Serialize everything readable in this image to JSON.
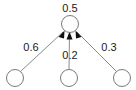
{
  "diagram": {
    "canvas": {
      "width": 136,
      "height": 90,
      "background": "#ffffff"
    },
    "style": {
      "node_stroke": "#7a7a7a",
      "node_fill": "#ffffff",
      "edge_stroke": "#8c8c8c",
      "arrow_fill": "#111111",
      "text_color": "#1a1a1a"
    },
    "output_node": {
      "id": "output",
      "label": "0.5",
      "cx": 70,
      "cy": 24,
      "r": 8.5
    },
    "input_nodes": [
      {
        "id": "input-left",
        "label": "",
        "cx": 15,
        "cy": 78,
        "r": 8.5
      },
      {
        "id": "input-middle",
        "label": "",
        "cx": 69,
        "cy": 78,
        "r": 8.5
      },
      {
        "id": "input-right",
        "label": "",
        "cx": 122,
        "cy": 78,
        "r": 8.5
      }
    ],
    "edges": [
      {
        "id": "edge-left",
        "from": "input-left",
        "to": "output",
        "weight": "0.6",
        "label_x": 31,
        "label_y": 51
      },
      {
        "id": "edge-middle",
        "from": "input-middle",
        "to": "output",
        "weight": "0.2",
        "label_x": 70,
        "label_y": 59
      },
      {
        "id": "edge-right",
        "from": "input-right",
        "to": "output",
        "weight": "0.3",
        "label_x": 109,
        "label_y": 51
      }
    ]
  }
}
